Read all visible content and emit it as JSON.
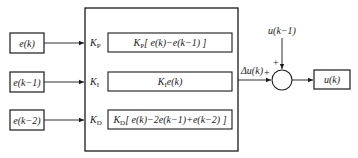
{
  "inputs": [
    {
      "label": "e(k)"
    },
    {
      "label": "e(k−1)"
    },
    {
      "label": "e(k−2)"
    }
  ],
  "gains": [
    {
      "label": "K",
      "sub": "P"
    },
    {
      "label": "K",
      "sub": "I"
    },
    {
      "label": "K",
      "sub": "D"
    }
  ],
  "terms": [
    {
      "label": "K",
      "sub": "P",
      "expr": "[ e(k)−e(k−1) ]"
    },
    {
      "label": "K",
      "sub": "I",
      "expr": "e(k)"
    },
    {
      "label": "K",
      "sub": "D",
      "expr": "[ e(k)−2e(k−1)+e(k−2) ]"
    }
  ],
  "delta_label": "Δu(k)",
  "feedback_label": "u(k−1)",
  "sum_signs": {
    "top": "+",
    "left": "+"
  },
  "output_label": "u(k)",
  "colors": {
    "line": "#1a1a1a",
    "background": "#ffffff"
  }
}
